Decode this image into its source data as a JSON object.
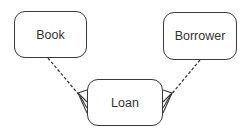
{
  "diagram": {
    "type": "entity-relationship",
    "entities": [
      {
        "id": "book",
        "label": "Book"
      },
      {
        "id": "borrower",
        "label": "Borrower"
      },
      {
        "id": "loan",
        "label": "Loan"
      }
    ],
    "relationships": [
      {
        "from": "book",
        "to": "loan",
        "line_style": "dashed",
        "from_cardinality": "one",
        "to_cardinality": "many"
      },
      {
        "from": "borrower",
        "to": "loan",
        "line_style": "dashed",
        "from_cardinality": "one",
        "to_cardinality": "many"
      }
    ],
    "colors": {
      "stroke": "#3a3a3a",
      "text": "#333333",
      "background": "#ffffff"
    }
  }
}
